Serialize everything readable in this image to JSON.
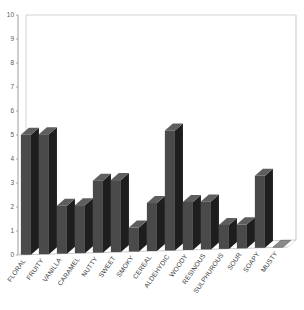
{
  "chart_data": {
    "type": "bar",
    "title": "",
    "subtitle": "",
    "xlabel": "",
    "ylabel": "",
    "categories": [
      "FLORAL",
      "FRUITY",
      "VANILLA",
      "CARAMEL",
      "NUTTY",
      "SWEET",
      "SMOKY",
      "CEREAL",
      "ALDEHYDIC",
      "WOODY",
      "RESINOUS",
      "SULPHUROUS",
      "SOUR",
      "SOAPY",
      "MUSTY"
    ],
    "values": [
      5,
      5,
      2,
      2,
      3,
      3,
      1,
      2,
      5,
      2,
      2,
      1,
      1,
      3,
      0
    ],
    "ylim": [
      0,
      10
    ],
    "ytick_labels": [
      "0",
      "1",
      "2",
      "3",
      "4",
      "5",
      "6",
      "7",
      "8",
      "9",
      "10"
    ],
    "ytick_values": [
      0,
      1,
      2,
      3,
      4,
      5,
      6,
      7,
      8,
      9,
      10
    ],
    "grid": false,
    "legend": false,
    "legend_position": "none",
    "style": "3d-column",
    "bar_face_color": "#4a4a4a",
    "bar_side_color": "#1e1e1e",
    "bar_top_color": "#5e5e5e",
    "plot_background": "#ffffff",
    "frame_color": "#c8c8c8",
    "axis_color": "#8f8f8f",
    "tick_label_color": "#5a5a5a",
    "category_label_color": "#3d3d3d",
    "category_label_rotation": -55
  }
}
